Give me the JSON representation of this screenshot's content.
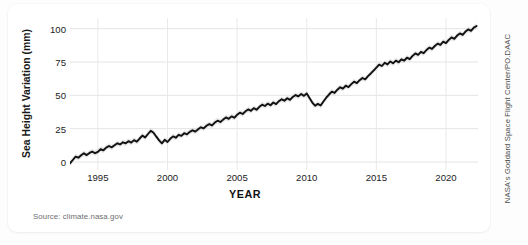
{
  "credit": "NASA's Goddard Space Flight Center/PO.DAAC",
  "source": "Source: climate.nasa.gov",
  "chart_data": {
    "type": "line",
    "title": "",
    "xlabel": "YEAR",
    "ylabel": "Sea Height Variation (mm)",
    "xlim": [
      1993.0,
      2022.3
    ],
    "ylim": [
      -6,
      108
    ],
    "xticks": [
      1995,
      2000,
      2005,
      2010,
      2015,
      2020
    ],
    "xtick_labels": [
      "1995",
      "2000",
      "2005",
      "2010",
      "2015",
      "2020"
    ],
    "yticks": [
      0,
      25,
      50,
      75,
      100
    ],
    "ytick_labels": [
      "0",
      "25",
      "50",
      "75",
      "100"
    ],
    "grid": true,
    "legend": "none",
    "line_color": "#111111",
    "band_color": "#c9c9c9",
    "series": [
      {
        "name": "Sea Height Variation",
        "x": [
          1993.0,
          1993.2,
          1993.4,
          1993.6,
          1993.8,
          1994.0,
          1994.2,
          1994.4,
          1994.6,
          1994.8,
          1995.0,
          1995.2,
          1995.4,
          1995.6,
          1995.8,
          1996.0,
          1996.2,
          1996.4,
          1996.6,
          1996.8,
          1997.0,
          1997.2,
          1997.4,
          1997.6,
          1997.8,
          1998.0,
          1998.2,
          1998.4,
          1998.6,
          1998.8,
          1999.0,
          1999.2,
          1999.4,
          1999.6,
          1999.8,
          2000.0,
          2000.2,
          2000.4,
          2000.6,
          2000.8,
          2001.0,
          2001.2,
          2001.4,
          2001.6,
          2001.8,
          2002.0,
          2002.2,
          2002.4,
          2002.6,
          2002.8,
          2003.0,
          2003.2,
          2003.4,
          2003.6,
          2003.8,
          2004.0,
          2004.2,
          2004.4,
          2004.6,
          2004.8,
          2005.0,
          2005.2,
          2005.4,
          2005.6,
          2005.8,
          2006.0,
          2006.2,
          2006.4,
          2006.6,
          2006.8,
          2007.0,
          2007.2,
          2007.4,
          2007.6,
          2007.8,
          2008.0,
          2008.2,
          2008.4,
          2008.6,
          2008.8,
          2009.0,
          2009.2,
          2009.4,
          2009.6,
          2009.8,
          2010.0,
          2010.2,
          2010.4,
          2010.6,
          2010.8,
          2011.0,
          2011.2,
          2011.4,
          2011.6,
          2011.8,
          2012.0,
          2012.2,
          2012.4,
          2012.6,
          2012.8,
          2013.0,
          2013.2,
          2013.4,
          2013.6,
          2013.8,
          2014.0,
          2014.2,
          2014.4,
          2014.6,
          2014.8,
          2015.0,
          2015.2,
          2015.4,
          2015.6,
          2015.8,
          2016.0,
          2016.2,
          2016.4,
          2016.6,
          2016.8,
          2017.0,
          2017.2,
          2017.4,
          2017.6,
          2017.8,
          2018.0,
          2018.2,
          2018.4,
          2018.6,
          2018.8,
          2019.0,
          2019.2,
          2019.4,
          2019.6,
          2019.8,
          2020.0,
          2020.2,
          2020.4,
          2020.6,
          2020.8,
          2021.0,
          2021.2,
          2021.4,
          2021.6,
          2021.8,
          2022.0,
          2022.2
        ],
        "values": [
          -1.0,
          1.5,
          4.0,
          3.2,
          5.0,
          6.5,
          5.2,
          6.8,
          7.8,
          6.6,
          7.6,
          9.6,
          8.8,
          10.8,
          12.0,
          11.0,
          12.6,
          14.0,
          13.2,
          14.8,
          14.0,
          15.6,
          14.6,
          16.4,
          15.2,
          17.6,
          19.8,
          18.4,
          21.0,
          23.4,
          22.0,
          19.0,
          16.2,
          14.0,
          16.6,
          15.0,
          17.4,
          19.2,
          18.2,
          20.4,
          19.6,
          21.6,
          20.8,
          22.6,
          23.8,
          22.8,
          24.6,
          26.0,
          25.2,
          27.2,
          28.4,
          27.4,
          29.6,
          31.0,
          30.0,
          31.8,
          33.4,
          32.4,
          34.2,
          33.2,
          35.4,
          37.0,
          36.0,
          38.0,
          39.4,
          38.4,
          40.4,
          39.2,
          41.4,
          43.0,
          42.0,
          43.8,
          42.6,
          44.6,
          43.4,
          45.6,
          47.0,
          46.0,
          47.8,
          46.6,
          48.8,
          50.2,
          49.2,
          51.0,
          49.6,
          51.4,
          48.0,
          44.6,
          42.2,
          43.6,
          42.4,
          45.4,
          48.2,
          50.6,
          52.8,
          51.8,
          54.2,
          56.0,
          55.0,
          57.2,
          56.2,
          58.4,
          60.2,
          59.2,
          61.4,
          63.0,
          62.0,
          64.4,
          66.4,
          68.6,
          70.8,
          73.0,
          72.0,
          74.4,
          73.2,
          75.4,
          74.0,
          76.0,
          74.8,
          77.0,
          76.0,
          78.2,
          77.2,
          79.6,
          81.4,
          80.4,
          82.6,
          81.6,
          84.0,
          85.8,
          84.8,
          87.0,
          88.8,
          87.8,
          90.2,
          89.2,
          91.6,
          93.4,
          92.4,
          94.8,
          96.4,
          95.4,
          97.8,
          99.4,
          98.4,
          100.8,
          102.0
        ],
        "uncertainty_mm": 2.0
      }
    ]
  }
}
